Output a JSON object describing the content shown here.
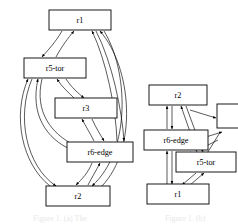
{
  "figure": {
    "background_color": "#ffffff",
    "stroke_color": "#000000",
    "width": 238,
    "height": 224,
    "caption_left": "Figure 1. (a) The",
    "caption_right": "Figure 1. (b)"
  },
  "graphs": [
    {
      "id": "left-graph",
      "name": "left-topology-graph",
      "nodes": [
        {
          "id": "l-r1",
          "label": "r1",
          "x": 80,
          "y": 20,
          "w": 62,
          "h": 20
        },
        {
          "id": "l-r5tor",
          "label": "r5-tor",
          "x": 55,
          "y": 68,
          "w": 62,
          "h": 20
        },
        {
          "id": "l-r3",
          "label": "r3",
          "x": 86,
          "y": 108,
          "w": 62,
          "h": 20
        },
        {
          "id": "l-r6edge",
          "label": "r6-edge",
          "x": 100,
          "y": 152,
          "w": 66,
          "h": 20
        },
        {
          "id": "l-r2",
          "label": "r2",
          "x": 78,
          "y": 196,
          "w": 64,
          "h": 20
        }
      ],
      "edges": [
        {
          "from": "l-r1",
          "to": "l-r5tor"
        },
        {
          "from": "l-r5tor",
          "to": "l-r1"
        },
        {
          "from": "l-r5tor",
          "to": "l-r3"
        },
        {
          "from": "l-r3",
          "to": "l-r5tor"
        },
        {
          "from": "l-r3",
          "to": "l-r6edge"
        },
        {
          "from": "l-r6edge",
          "to": "l-r3"
        },
        {
          "from": "l-r6edge",
          "to": "l-r2"
        },
        {
          "from": "l-r2",
          "to": "l-r6edge"
        },
        {
          "from": "l-r1",
          "to": "l-r6edge"
        },
        {
          "from": "l-r6edge",
          "to": "l-r1"
        },
        {
          "from": "l-r1",
          "to": "l-r2"
        },
        {
          "from": "l-r2",
          "to": "l-r1"
        },
        {
          "from": "l-r5tor",
          "to": "l-r2"
        },
        {
          "from": "l-r2",
          "to": "l-r5tor"
        },
        {
          "from": "l-r5tor",
          "to": "l-r6edge"
        },
        {
          "from": "l-r6edge",
          "to": "l-r5tor"
        }
      ]
    },
    {
      "id": "right-graph",
      "name": "right-topology-graph",
      "nodes": [
        {
          "id": "r-r2",
          "label": "r2",
          "x": 178,
          "y": 95,
          "w": 58,
          "h": 20
        },
        {
          "id": "r-r6edge",
          "label": "r6-edge",
          "x": 176,
          "y": 140,
          "w": 64,
          "h": 20
        },
        {
          "id": "r-r5tor",
          "label": "r5-tor",
          "x": 206,
          "y": 162,
          "w": 60,
          "h": 20
        },
        {
          "id": "r-r1",
          "label": "r1",
          "x": 178,
          "y": 194,
          "w": 62,
          "h": 20
        },
        {
          "id": "r-cut",
          "label": "",
          "x": 233,
          "y": 116,
          "w": 32,
          "h": 24
        }
      ],
      "edges": [
        {
          "from": "r-r2",
          "to": "r-r6edge"
        },
        {
          "from": "r-r6edge",
          "to": "r-r2"
        },
        {
          "from": "r-r6edge",
          "to": "r-r1"
        },
        {
          "from": "r-r1",
          "to": "r-r6edge"
        },
        {
          "from": "r-r2",
          "to": "r-r5tor"
        },
        {
          "from": "r-r5tor",
          "to": "r-r2"
        },
        {
          "from": "r-r5tor",
          "to": "r-r1"
        },
        {
          "from": "r-r1",
          "to": "r-r5tor"
        },
        {
          "from": "r-r6edge",
          "to": "r-r5tor"
        },
        {
          "from": "r-r5tor",
          "to": "r-r6edge"
        },
        {
          "from": "r-r2",
          "to": "r-cut"
        },
        {
          "from": "r-cut",
          "to": "r-r5tor"
        }
      ]
    }
  ]
}
